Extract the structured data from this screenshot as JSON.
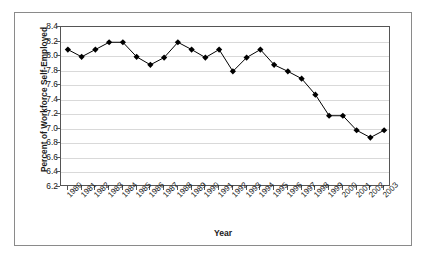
{
  "chart_data": {
    "type": "line",
    "title": "",
    "xlabel": "Year",
    "ylabel": "Percent of Workforce Self-Employed",
    "categories": [
      "1980",
      "1981",
      "1982",
      "1983",
      "1984",
      "1985",
      "1986",
      "1987",
      "1988",
      "1989",
      "1990",
      "1991",
      "1992",
      "1993",
      "1994",
      "1995",
      "1996",
      "1997",
      "1998",
      "1999",
      "2000",
      "2001",
      "2002",
      "2003"
    ],
    "values": [
      8.09,
      7.99,
      8.09,
      8.19,
      8.19,
      7.99,
      7.88,
      7.98,
      8.19,
      8.09,
      7.98,
      8.09,
      7.79,
      7.98,
      8.09,
      7.88,
      7.79,
      7.69,
      7.47,
      7.18,
      7.18,
      6.98,
      6.88,
      6.98
    ],
    "ylim": [
      6.2,
      8.4
    ],
    "ytick_labels": [
      "8.4",
      "8.2",
      "8.0",
      "7.8",
      "7.6",
      "7.4",
      "7.2",
      "7.0",
      "6.8",
      "6.6",
      "6.4",
      "6.2"
    ],
    "ytick_values": [
      8.4,
      8.2,
      8.0,
      7.8,
      7.6,
      7.4,
      7.2,
      7.0,
      6.8,
      6.6,
      6.4,
      6.2
    ],
    "grid": true,
    "legend": false,
    "marker": "diamond",
    "series_color": "#000000",
    "grid_color": "#d9d9d9",
    "axis_color": "#555555",
    "frame_color": "#8a8a8a",
    "background": "#ffffff"
  }
}
